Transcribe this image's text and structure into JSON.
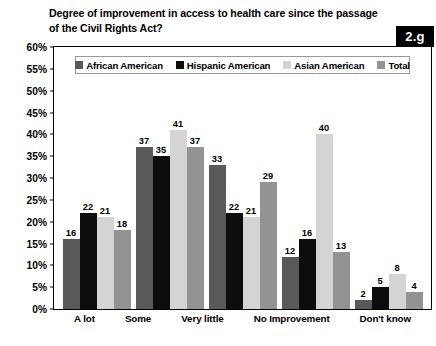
{
  "badge": {
    "label": "2.g"
  },
  "chart_data": {
    "type": "bar",
    "title": "Degree of improvement in access to health care since the passage\nof the Civil Rights Act?",
    "xlabel": "",
    "ylabel": "",
    "ylim": [
      0,
      60
    ],
    "ytick_step": 5,
    "grid": false,
    "legend_position": "top-center",
    "value_suffix": "",
    "axis_tick_labels": [
      "0%",
      "5%",
      "10%",
      "15%",
      "20%",
      "25%",
      "30%",
      "35%",
      "40%",
      "45%",
      "50%",
      "55%",
      "60%"
    ],
    "categories": [
      "A lot",
      "Some",
      "Very little",
      "No Improvement",
      "Don't know"
    ],
    "series": [
      {
        "name": "African American",
        "color": "#595959",
        "values": [
          16,
          37,
          33,
          12,
          2
        ]
      },
      {
        "name": "Hispanic American",
        "color": "#0d0d0d",
        "values": [
          22,
          35,
          22,
          16,
          5
        ]
      },
      {
        "name": "Asian American",
        "color": "#d4d4d4",
        "values": [
          21,
          41,
          21,
          40,
          8
        ]
      },
      {
        "name": "Total",
        "color": "#939393",
        "values": [
          18,
          37,
          29,
          13,
          4
        ]
      }
    ]
  }
}
